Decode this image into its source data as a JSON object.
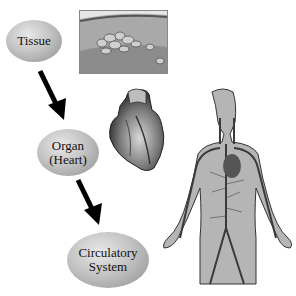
{
  "diagram": {
    "nodes": [
      {
        "id": "tissue",
        "lines": [
          "Tissue"
        ]
      },
      {
        "id": "organ",
        "lines": [
          "Organ",
          "(Heart)"
        ]
      },
      {
        "id": "system",
        "lines": [
          "Circulatory",
          "System"
        ]
      }
    ],
    "edges": [
      {
        "from": "tissue",
        "to": "organ"
      },
      {
        "from": "organ",
        "to": "system"
      }
    ],
    "images": [
      {
        "id": "tissue-micrograph",
        "description": "tissue cross-section"
      },
      {
        "id": "heart-illustration",
        "description": "human heart"
      },
      {
        "id": "body-illustration",
        "description": "human body with circulatory system"
      }
    ]
  }
}
